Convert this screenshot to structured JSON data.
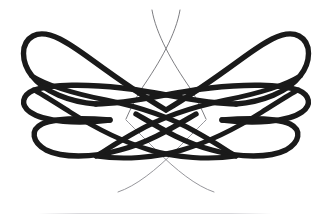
{
  "artwork": {
    "title": "Calligraphic Flourish Ornament",
    "type": "decorative-vector-ornament",
    "width": 332,
    "height": 218,
    "background_color": "#ffffff",
    "stroke_color": "#1a1a1a",
    "hairline_color": "#6e6e73",
    "symmetry": "bilateral-horizontal",
    "mirror_axis_x": 166,
    "description": "Symmetric double-infinity calligraphic swash built from three mirrored loop ribbons crossing at center, with tapering hairline tails crossing above and below.",
    "bold_stroke_width": 5.4,
    "hairline_stroke_width": 0.8,
    "loops": [
      {
        "name": "outer-loop-left",
        "tip_x": 22,
        "tip_y": 60,
        "top_y": 30,
        "bottom_y": 92
      },
      {
        "name": "outer-loop-right",
        "tip_x": 310,
        "tip_y": 60,
        "top_y": 30,
        "bottom_y": 92
      },
      {
        "name": "middle-loop-left",
        "tip_x": 22,
        "tip_y": 103,
        "top_y": 86,
        "bottom_y": 120
      },
      {
        "name": "middle-loop-right",
        "tip_x": 310,
        "tip_y": 103,
        "top_y": 86,
        "bottom_y": 120
      },
      {
        "name": "lower-loop-left",
        "tip_x": 30,
        "tip_y": 130,
        "top_y": 114,
        "bottom_y": 158
      },
      {
        "name": "lower-loop-right",
        "tip_x": 302,
        "tip_y": 130,
        "top_y": 114,
        "bottom_y": 158
      }
    ],
    "hairline_tails": [
      {
        "name": "tail-top-left",
        "start_x": 152,
        "start_y": 10,
        "end_x": 205,
        "end_y": 118
      },
      {
        "name": "tail-top-right",
        "start_x": 180,
        "start_y": 10,
        "end_x": 127,
        "end_y": 118
      },
      {
        "name": "tail-bottom-left",
        "start_x": 118,
        "start_y": 192,
        "end_x": 205,
        "end_y": 120
      },
      {
        "name": "tail-bottom-right",
        "start_x": 214,
        "start_y": 192,
        "end_x": 127,
        "end_y": 120
      }
    ],
    "crossing_points": [
      {
        "name": "top-hairline-crossing",
        "x": 166,
        "y": 42
      },
      {
        "name": "upper-bold-crossing",
        "x": 166,
        "y": 78
      },
      {
        "name": "center-bold-crossing",
        "x": 166,
        "y": 110
      },
      {
        "name": "lower-bold-crossing",
        "x": 166,
        "y": 140
      },
      {
        "name": "bottom-hairline-crossing",
        "x": 168,
        "y": 180
      }
    ]
  },
  "baseline": {
    "name": "faint-horizontal-rule",
    "left": 38,
    "top": 213,
    "width": 234,
    "color": "#d8d8dc",
    "thickness": 1
  }
}
